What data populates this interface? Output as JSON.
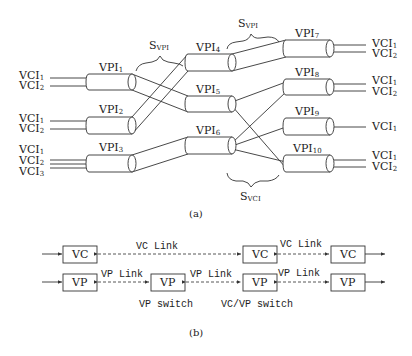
{
  "part_a": {
    "caption": "(a)",
    "braces": {
      "svpi_left": {
        "main": "S",
        "sub": "VPI"
      },
      "svpi_right": {
        "main": "S",
        "sub": "VPI"
      },
      "svci": {
        "main": "S",
        "sub": "VCI"
      }
    },
    "vpi": [
      {
        "main": "VPI",
        "sub": "1"
      },
      {
        "main": "VPI",
        "sub": "2"
      },
      {
        "main": "VPI",
        "sub": "3"
      },
      {
        "main": "VPI",
        "sub": "4"
      },
      {
        "main": "VPI",
        "sub": "5"
      },
      {
        "main": "VPI",
        "sub": "6"
      },
      {
        "main": "VPI",
        "sub": "7"
      },
      {
        "main": "VPI",
        "sub": "8"
      },
      {
        "main": "VPI",
        "sub": "9"
      },
      {
        "main": "VPI",
        "sub": "10"
      }
    ],
    "left_vci": [
      [
        {
          "main": "VCI",
          "sub": "1"
        },
        {
          "main": "VCI",
          "sub": "2"
        }
      ],
      [
        {
          "main": "VCI",
          "sub": "1"
        },
        {
          "main": "VCI",
          "sub": "2"
        }
      ],
      [
        {
          "main": "VCI",
          "sub": "1"
        },
        {
          "main": "VCI",
          "sub": "2"
        },
        {
          "main": "VCI",
          "sub": "3"
        }
      ]
    ],
    "right_vci": [
      [
        {
          "main": "VCI",
          "sub": "1"
        },
        {
          "main": "VCI",
          "sub": "2"
        }
      ],
      [
        {
          "main": "VCI",
          "sub": "1"
        },
        {
          "main": "VCI",
          "sub": "2"
        }
      ],
      [
        {
          "main": "VCI",
          "sub": "1"
        }
      ],
      [
        {
          "main": "VCI",
          "sub": "1"
        },
        {
          "main": "VCI",
          "sub": "2"
        }
      ]
    ]
  },
  "part_b": {
    "caption": "(b)",
    "vc_row": {
      "boxes": [
        "VC",
        "VC",
        "VC"
      ],
      "links": [
        "VC Link",
        "VC Link"
      ]
    },
    "vp_row": {
      "boxes": [
        "VP",
        "VP",
        "VP",
        "VP"
      ],
      "links": [
        "VP Link",
        "VP Link",
        "VP Link"
      ]
    },
    "switch_labels": [
      "VP switch",
      "VC/VP switch"
    ]
  }
}
